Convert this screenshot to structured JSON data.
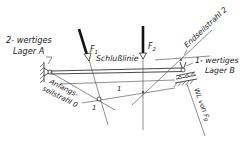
{
  "diagram": {
    "type": "funicular polygon (Seileck) construction",
    "labels": {
      "lager_a_line1": "2- wertiges",
      "lager_a_line2": "Lager A",
      "lager_b_line1": "1- wertiges",
      "lager_b_line2": "Lager B",
      "force_1": "F",
      "force_1_sub": "1",
      "force_2": "F",
      "force_2_sub": "2",
      "closing_line": "Schlußlinie",
      "start_ray_line1": "Anfangs-",
      "start_ray_line2": "seilstrahl 0",
      "end_ray": "Endseilstrahl 2",
      "ray_1_upper": "1",
      "ray_1_lower": "1",
      "line_of_action_b": "WL von F",
      "line_of_action_b_sub": "B"
    },
    "colors": {
      "ink": "#222222",
      "background": "#ffffff"
    }
  }
}
